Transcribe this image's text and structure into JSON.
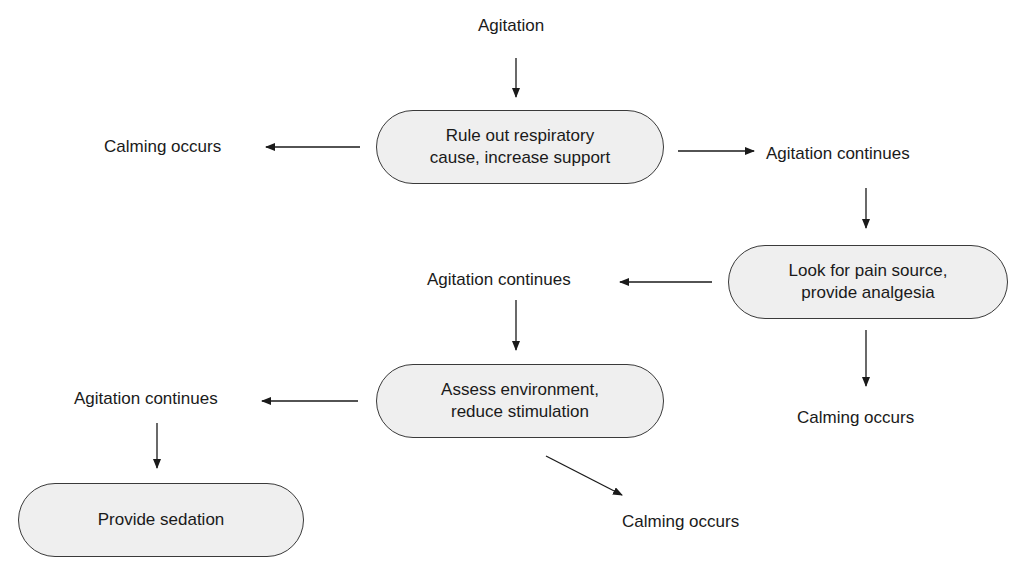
{
  "diagram": {
    "type": "flowchart",
    "nodes": {
      "start": "Agitation",
      "respiratory": "Rule out respiratory\ncause, increase support",
      "pain": "Look for pain source,\nprovide analgesia",
      "environment": "Assess environment,\nreduce stimulation",
      "sedation": "Provide sedation"
    },
    "outcomes": {
      "calm_1": "Calming occurs",
      "continue_1": "Agitation continues",
      "continue_2": "Agitation continues",
      "calm_2": "Calming occurs",
      "continue_3": "Agitation continues",
      "calm_3": "Calming occurs"
    },
    "edges": [
      {
        "from": "start",
        "to": "respiratory"
      },
      {
        "from": "respiratory",
        "to": "calm_1"
      },
      {
        "from": "respiratory",
        "to": "continue_1"
      },
      {
        "from": "continue_1",
        "to": "pain"
      },
      {
        "from": "pain",
        "to": "continue_2"
      },
      {
        "from": "pain",
        "to": "calm_2"
      },
      {
        "from": "continue_2",
        "to": "environment"
      },
      {
        "from": "environment",
        "to": "continue_3"
      },
      {
        "from": "environment",
        "to": "calm_3"
      },
      {
        "from": "continue_3",
        "to": "sedation"
      }
    ],
    "colors": {
      "node_fill": "#efefef",
      "stroke": "#3a3a3a",
      "text": "#1a1a1a"
    }
  }
}
